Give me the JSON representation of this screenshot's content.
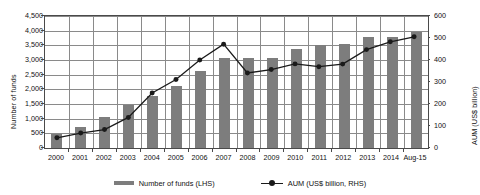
{
  "chart_data": {
    "type": "bar",
    "title": "",
    "xlabel": "",
    "ylabel": "Number of funds",
    "y2label": "AUM (US$ billion)",
    "grid": true,
    "legend_position": "bottom",
    "ylim": [
      0,
      4500
    ],
    "y2lim": [
      0,
      600
    ],
    "ytick_step": 500,
    "y2tick_step": 100,
    "categories": [
      "2000",
      "2001",
      "2002",
      "2003",
      "2004",
      "2005",
      "2006",
      "2007",
      "2008",
      "2009",
      "2010",
      "2011",
      "2012",
      "2013",
      "2014",
      "Aug-15"
    ],
    "yticks_left": [
      "0",
      "500",
      "1,000",
      "1,500",
      "2,000",
      "2,500",
      "3,000",
      "3,500",
      "4,000",
      "4,500"
    ],
    "yticks_right": [
      "0",
      "100",
      "200",
      "300",
      "400",
      "500",
      "600"
    ],
    "series": [
      {
        "name": "Number of funds (LHS)",
        "type": "bar",
        "axis": "left",
        "color": "#7d7d7d",
        "values": [
          490,
          720,
          1060,
          1450,
          1790,
          2120,
          2620,
          3080,
          3060,
          3080,
          3380,
          3520,
          3530,
          3790,
          3790,
          3950
        ]
      },
      {
        "name": "AUM (US$ billion, RHS)",
        "type": "line",
        "axis": "right",
        "color": "#1a1a1a",
        "values": [
          38,
          60,
          76,
          132,
          245,
          307,
          397,
          470,
          337,
          353,
          379,
          366,
          378,
          445,
          481,
          504
        ]
      }
    ],
    "legend": [
      "Number of funds (LHS)",
      "AUM (US$ billion, RHS)"
    ]
  }
}
